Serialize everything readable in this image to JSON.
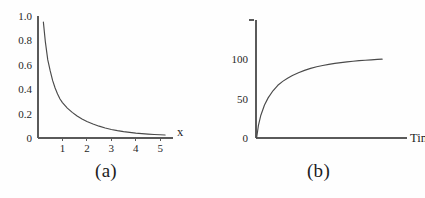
{
  "figure": {
    "background_color": "#fefefe",
    "axis_color": "#5a5a5a",
    "curve_color": "#4a4a4a",
    "text_color": "#262626"
  },
  "panels": [
    {
      "id": "a",
      "caption": "(a)",
      "xlabel": "x",
      "ylabel": "",
      "ytick_labels": [
        "1.0",
        "0.8",
        "0.6",
        "0.4",
        "0.2",
        "0"
      ],
      "xtick_labels": [
        "1",
        "2",
        "3",
        "4",
        "5"
      ]
    },
    {
      "id": "b",
      "caption": "(b)",
      "xlabel": "Time",
      "ylabel": "",
      "ytick_labels": [
        "100",
        "50",
        "0"
      ],
      "xtick_labels": []
    }
  ],
  "chart_data": [
    {
      "type": "line",
      "title": "(a)",
      "xlabel": "x",
      "ylabel": "",
      "xlim": [
        0,
        5.4
      ],
      "ylim": [
        0,
        1.0
      ],
      "xticks": [
        1,
        2,
        3,
        4,
        5
      ],
      "yticks": [
        0,
        0.2,
        0.4,
        0.6,
        0.8,
        1.0
      ],
      "xtick_labels": [
        "1",
        "2",
        "3",
        "4",
        "5"
      ],
      "ytick_labels": [
        "0",
        "0.2",
        "0.4",
        "0.6",
        "0.8",
        "1.0"
      ],
      "grid": false,
      "legend": false,
      "description": "Monotonically decreasing convex decay curve approaching zero asymptotically",
      "series": [
        {
          "name": "decay",
          "x": [
            0.22,
            0.3,
            0.4,
            0.5,
            0.6,
            0.7,
            0.8,
            0.9,
            1.0,
            1.2,
            1.4,
            1.6,
            1.8,
            2.0,
            2.25,
            2.5,
            2.75,
            3.0,
            3.25,
            3.5,
            3.75,
            4.0,
            4.25,
            4.5,
            4.75,
            5.0,
            5.2
          ],
          "y": [
            0.95,
            0.79,
            0.64,
            0.55,
            0.47,
            0.41,
            0.36,
            0.32,
            0.29,
            0.245,
            0.21,
            0.18,
            0.155,
            0.135,
            0.115,
            0.097,
            0.082,
            0.07,
            0.06,
            0.052,
            0.046,
            0.04,
            0.036,
            0.032,
            0.029,
            0.027,
            0.025
          ]
        }
      ]
    },
    {
      "type": "line",
      "title": "(b)",
      "xlabel": "Time",
      "ylabel": "",
      "xlim": [
        0,
        10.8
      ],
      "ylim": [
        0,
        150
      ],
      "xticks": [],
      "yticks": [
        0,
        50,
        100
      ],
      "xtick_labels": [],
      "ytick_labels": [
        "0",
        "50",
        "100"
      ],
      "grid": false,
      "legend": false,
      "description": "Saturating growth curve rising steeply then leveling off near 100",
      "series": [
        {
          "name": "saturation",
          "x": [
            0.05,
            0.2,
            0.4,
            0.7,
            1.0,
            1.4,
            1.8,
            2.2,
            2.6,
            3.0,
            3.5,
            4.0,
            4.5,
            5.0,
            5.5,
            6.0,
            6.5,
            7.0,
            7.5,
            8.0,
            8.5,
            9.0,
            9.5,
            10.0,
            10.4
          ],
          "y": [
            0,
            16,
            29,
            42,
            51,
            60,
            67,
            72,
            76,
            79.5,
            83,
            86,
            88.5,
            90.5,
            92.2,
            93.6,
            94.8,
            95.9,
            96.8,
            97.6,
            98.3,
            98.9,
            99.4,
            99.9,
            100.2
          ]
        }
      ]
    }
  ]
}
